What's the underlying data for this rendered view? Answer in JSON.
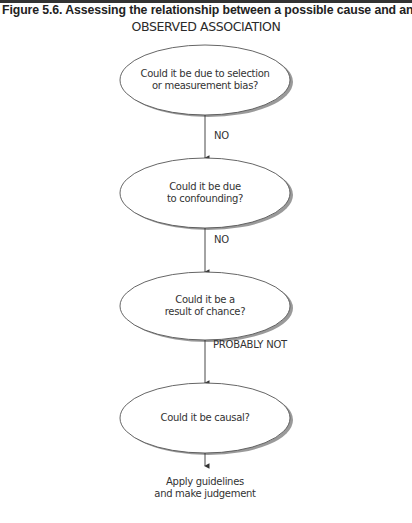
{
  "figure": {
    "title": "Figure 5.6. Assessing the relationship between a possible cause and an outcome",
    "start": "OBSERVED ASSOCIATION"
  },
  "nodes": [
    {
      "id": "q1",
      "text": "Could it be due to selection\nor measurement bias?"
    },
    {
      "id": "q2",
      "text": "Could it be due\nto confounding?"
    },
    {
      "id": "q3",
      "text": "Could it be a\nresult of chance?"
    },
    {
      "id": "q4",
      "text": "Could it be causal?"
    }
  ],
  "edges": [
    {
      "from": "q1",
      "to": "q2",
      "label": "NO"
    },
    {
      "from": "q2",
      "to": "q3",
      "label": "NO"
    },
    {
      "from": "q3",
      "to": "q4",
      "label": "PROBABLY NOT"
    },
    {
      "from": "q4",
      "to": "end",
      "label": ""
    }
  ],
  "end": {
    "text": "Apply guidelines\nand make judgement"
  },
  "colors": {
    "stroke": "#555555",
    "shadow": "#9a9a9a",
    "text": "#333333"
  }
}
